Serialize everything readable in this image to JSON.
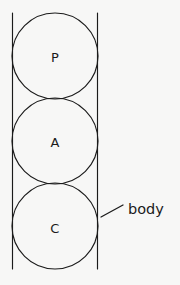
{
  "figure": {
    "background_color": "#f7f7f6",
    "ink_color": "#1b1b1b",
    "width": 180,
    "height": 285
  },
  "body_outline": {
    "name": "body",
    "left_x": 12.5,
    "right_x": 97.5,
    "top_y": 13,
    "bottom_y": 269
  },
  "circles": [
    {
      "label": "P",
      "cx": 55,
      "cy": 56,
      "r": 43,
      "label_x": 55,
      "label_y": 57
    },
    {
      "label": "A",
      "cx": 55,
      "cy": 141,
      "r": 43,
      "label_x": 55,
      "label_y": 142
    },
    {
      "label": "C",
      "cx": 55,
      "cy": 226,
      "r": 43,
      "label_x": 55,
      "label_y": 228
    }
  ],
  "callout": {
    "label": "body",
    "leader_start_x": 101,
    "leader_start_y": 217,
    "leader_end_x": 123,
    "leader_end_y": 205,
    "text_x": 128,
    "text_y": 209
  }
}
